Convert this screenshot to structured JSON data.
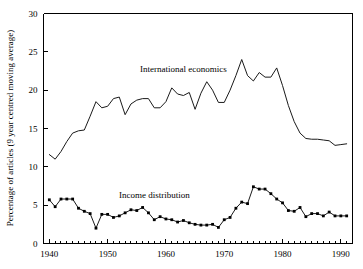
{
  "chart_data": {
    "type": "line",
    "title": "",
    "xlabel": "",
    "ylabel": "Percentage of articles (9 year centred moving average)",
    "xlim": [
      1939,
      1992
    ],
    "ylim": [
      0,
      30
    ],
    "grid": false,
    "legend_position": "inline-annotation",
    "x_ticks_major": [
      1940,
      1950,
      1960,
      1970,
      1980,
      1990
    ],
    "x_tick_labels": [
      "1940",
      "1950",
      "1960",
      "1970",
      "1980",
      "1990"
    ],
    "x_minor_tick_step": 1,
    "y_ticks": [
      0,
      5,
      10,
      15,
      20,
      25,
      30
    ],
    "y_tick_labels": [
      "0",
      "5",
      "10",
      "15",
      "20",
      "25",
      "30"
    ],
    "series": [
      {
        "name": "International economics",
        "marker": "none",
        "label_x": 1963,
        "label_y": 22.4,
        "x": [
          1940,
          1941,
          1942,
          1943,
          1944,
          1945,
          1946,
          1947,
          1948,
          1949,
          1950,
          1951,
          1952,
          1953,
          1954,
          1955,
          1956,
          1957,
          1958,
          1959,
          1960,
          1961,
          1962,
          1963,
          1964,
          1965,
          1966,
          1967,
          1968,
          1969,
          1970,
          1971,
          1972,
          1973,
          1974,
          1975,
          1976,
          1977,
          1978,
          1979,
          1980,
          1981,
          1982,
          1983,
          1984,
          1985,
          1986,
          1987,
          1988,
          1989,
          1990,
          1991
        ],
        "values": [
          11.6,
          11.0,
          12.0,
          13.3,
          14.4,
          14.7,
          14.8,
          16.6,
          18.5,
          17.7,
          17.9,
          18.9,
          19.1,
          16.8,
          18.2,
          18.7,
          18.9,
          18.9,
          17.7,
          17.7,
          18.5,
          20.3,
          19.5,
          19.3,
          19.7,
          17.5,
          19.6,
          21.1,
          20.0,
          18.4,
          18.4,
          20.0,
          21.9,
          24.0,
          21.9,
          21.2,
          22.3,
          21.7,
          21.7,
          22.9,
          20.6,
          18.0,
          15.9,
          14.4,
          13.7,
          13.6,
          13.6,
          13.5,
          13.4,
          12.8,
          12.9,
          13.0
        ]
      },
      {
        "name": "Income distribution",
        "marker": "filled-square",
        "label_x": 1958,
        "label_y": 6.0,
        "x": [
          1940,
          1941,
          1942,
          1943,
          1944,
          1945,
          1946,
          1947,
          1948,
          1949,
          1950,
          1951,
          1952,
          1953,
          1954,
          1955,
          1956,
          1957,
          1958,
          1959,
          1960,
          1961,
          1962,
          1963,
          1964,
          1965,
          1966,
          1967,
          1968,
          1969,
          1970,
          1971,
          1972,
          1973,
          1974,
          1975,
          1976,
          1977,
          1978,
          1979,
          1980,
          1981,
          1982,
          1983,
          1984,
          1985,
          1986,
          1987,
          1988,
          1989,
          1990,
          1991
        ],
        "values": [
          5.7,
          4.8,
          5.8,
          5.8,
          5.8,
          4.6,
          4.2,
          3.9,
          2.0,
          3.8,
          3.8,
          3.4,
          3.6,
          4.0,
          4.4,
          4.3,
          4.7,
          4.0,
          3.1,
          3.5,
          3.2,
          3.1,
          2.8,
          3.0,
          2.7,
          2.5,
          2.4,
          2.4,
          2.5,
          2.1,
          3.1,
          3.4,
          4.6,
          5.4,
          5.2,
          7.4,
          7.1,
          7.1,
          6.5,
          5.8,
          5.3,
          4.3,
          4.2,
          4.7,
          3.5,
          3.9,
          3.9,
          3.6,
          4.1,
          3.6,
          3.6,
          3.6
        ]
      }
    ]
  }
}
